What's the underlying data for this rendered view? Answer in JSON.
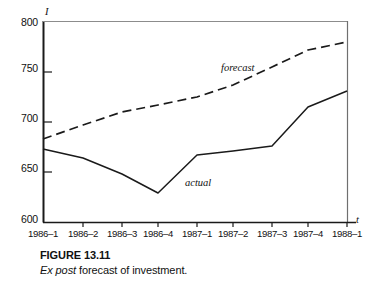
{
  "chart_data": {
    "type": "line",
    "title": "",
    "xlabel": "t",
    "ylabel": "I",
    "categories": [
      "1986–1",
      "1986–2",
      "1986–3",
      "1986–4",
      "1987–1",
      "1987–2",
      "1987–3",
      "1987–4",
      "1988–1"
    ],
    "ylim": [
      600,
      800
    ],
    "yticks": [
      600,
      650,
      700,
      750,
      800
    ],
    "ytick_labels": [
      "600",
      "650",
      "700",
      "750",
      "800"
    ],
    "grid": false,
    "legend_position": "inline-annotation",
    "series": [
      {
        "name": "actual",
        "style": "solid",
        "color": "#1a1a1a",
        "values": [
          673,
          664,
          648,
          629,
          667,
          671,
          676,
          715,
          731
        ]
      },
      {
        "name": "forecast",
        "style": "dashed",
        "color": "#1a1a1a",
        "values": [
          683,
          697,
          710,
          717,
          725,
          737,
          755,
          772,
          780
        ]
      }
    ],
    "annotations": [
      {
        "text": "forecast",
        "series": "forecast"
      },
      {
        "text": "actual",
        "series": "actual"
      }
    ]
  },
  "caption": {
    "figure_number": "FIGURE 13.11",
    "text_italic": "Ex post",
    "text_rest": " forecast of investment."
  }
}
